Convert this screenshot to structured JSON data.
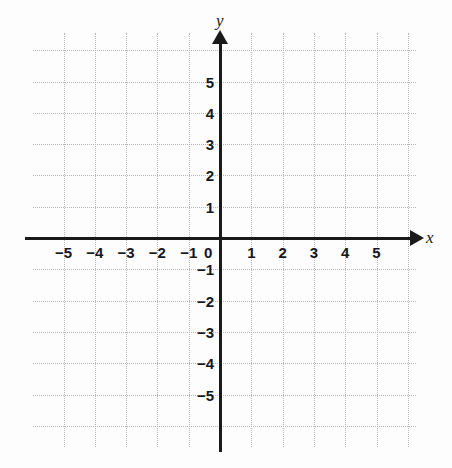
{
  "figure": {
    "kind": "cartesian-coordinate-plane",
    "background_color": "#fdfdfd",
    "axis_color": "#1a1a1a",
    "grid_color": "#b5b5ba"
  },
  "axes": {
    "x": {
      "name": "x",
      "arrow": "right",
      "tick_labels": [
        "−5",
        "−4",
        "−3",
        "−2",
        "−1",
        "1",
        "2",
        "3",
        "4",
        "5"
      ],
      "tick_values": [
        -5,
        -4,
        -3,
        -2,
        -1,
        1,
        2,
        3,
        4,
        5
      ]
    },
    "y": {
      "name": "y",
      "arrow": "up",
      "tick_labels": [
        "5",
        "4",
        "3",
        "2",
        "1",
        "−1",
        "−2",
        "−3",
        "−4",
        "−5"
      ],
      "tick_values": [
        5,
        4,
        3,
        2,
        1,
        -1,
        -2,
        -3,
        -4,
        -5
      ]
    },
    "origin_label": "0"
  },
  "chart_data": {
    "type": "scatter",
    "title": "",
    "xlabel": "x",
    "ylabel": "y",
    "xlim": [
      -6,
      6.3
    ],
    "ylim": [
      -6.7,
      6.5
    ],
    "xticks": [
      -5,
      -4,
      -3,
      -2,
      -1,
      0,
      1,
      2,
      3,
      4,
      5
    ],
    "yticks": [
      -5,
      -4,
      -3,
      -2,
      -1,
      0,
      1,
      2,
      3,
      4,
      5
    ],
    "xtick_labels": [
      "−5",
      "−4",
      "−3",
      "−2",
      "−1",
      "0",
      "1",
      "2",
      "3",
      "4",
      "5"
    ],
    "ytick_labels": [
      "−5",
      "−4",
      "−3",
      "−2",
      "−1",
      "0",
      "1",
      "2",
      "3",
      "4",
      "5"
    ],
    "grid": true,
    "grid_style": "dotted",
    "legend": null,
    "series": [],
    "annotations": [],
    "note": "Empty blank coordinate grid; no data is plotted."
  },
  "geometry": {
    "origin_px": {
      "x": 220,
      "y": 238
    },
    "unit_px": 31.3,
    "grid_box_px": {
      "left": 33,
      "top": 33,
      "width": 383,
      "height": 414
    }
  }
}
